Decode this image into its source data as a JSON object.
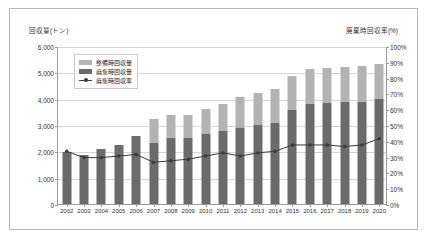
{
  "chart_data": {
    "type": "bar",
    "title": "",
    "subtitle": "",
    "xlabel": "",
    "ylabel": "回収量(トン)",
    "ylabel_right": "廃棄時回収率(%)",
    "categories": [
      "2002",
      "2003",
      "2004",
      "2005",
      "2006",
      "2007",
      "2008",
      "2009",
      "2010",
      "2011",
      "2012",
      "2013",
      "2014",
      "2015",
      "2016",
      "2017",
      "2018",
      "2019",
      "2020"
    ],
    "ylim": [
      0,
      6000
    ],
    "ylim_right": [
      0,
      100
    ],
    "ytick_labels": [
      "0",
      "1,000",
      "2,000",
      "3,000",
      "4,000",
      "5,000",
      "6,000"
    ],
    "ytick_values": [
      0,
      1000,
      2000,
      3000,
      4000,
      5000,
      6000
    ],
    "ytick_labels_right": [
      "0%",
      "10%",
      "20%",
      "30%",
      "40%",
      "50%",
      "60%",
      "70%",
      "80%",
      "90%",
      "100%"
    ],
    "ytick_values_right": [
      0,
      10,
      20,
      30,
      40,
      50,
      60,
      70,
      80,
      90,
      100
    ],
    "grid": true,
    "legend_position": "upper-left",
    "stacked": true,
    "series": [
      {
        "name": "整備時回収量",
        "type": "bar",
        "color": "#b3b3b3",
        "axis": "left",
        "values": [
          0,
          0,
          0,
          0,
          0,
          900,
          880,
          850,
          950,
          1030,
          1150,
          1200,
          1280,
          1300,
          1330,
          1350,
          1350,
          1380,
          1330
        ]
      },
      {
        "name": "廃棄時回収量",
        "type": "bar",
        "color": "#6b6b6b",
        "axis": "left",
        "values": [
          1980,
          1880,
          2080,
          2230,
          2580,
          2330,
          2490,
          2520,
          2650,
          2780,
          2900,
          3000,
          3080,
          3580,
          3780,
          3830,
          3870,
          3880,
          3970
        ]
      },
      {
        "name": "廃棄時回収率",
        "type": "line",
        "color": "#3a3a3a",
        "axis": "right",
        "values": [
          34,
          30,
          30,
          31,
          32,
          27,
          28,
          29,
          31,
          33,
          31,
          33,
          34,
          38,
          38,
          38,
          37,
          38,
          42
        ]
      }
    ]
  },
  "legend": {
    "items": [
      {
        "label": "整備時回収量",
        "marker": "swatch",
        "color": "#b3b3b3"
      },
      {
        "label": "廃棄時回収量",
        "marker": "swatch",
        "color": "#6b6b6b"
      },
      {
        "label": "廃棄時回収率",
        "marker": "line",
        "color": "#3a3a3a"
      }
    ]
  }
}
